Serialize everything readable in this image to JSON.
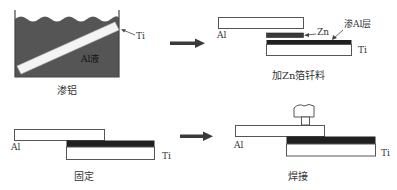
{
  "colors": {
    "liquid": "#555555",
    "outline": "#444444",
    "coating": "#1f1f1f",
    "arrow": "#3a3a3a",
    "plate_fill": "#ffffff"
  },
  "panels": [
    {
      "id": "aluminizing",
      "caption": "渗铝",
      "labels": {
        "liquid": "Al液",
        "strip": "Ti"
      }
    },
    {
      "id": "add-zn-foil",
      "caption": "加Zn箔钎料",
      "labels": {
        "top_plate": "Al",
        "foil": "Zn",
        "coating": "渗Al层",
        "bottom_plate": "Ti"
      }
    },
    {
      "id": "fixing",
      "caption": "固定",
      "labels": {
        "top_plate": "Al",
        "bottom_plate": "Ti"
      }
    },
    {
      "id": "welding",
      "caption": "焊接",
      "labels": {
        "top_plate": "Al",
        "bottom_plate": "Ti"
      }
    }
  ],
  "flow_arrows": [
    {
      "from": "aluminizing",
      "to": "add-zn-foil"
    },
    {
      "from": "fixing",
      "to": "welding"
    }
  ]
}
